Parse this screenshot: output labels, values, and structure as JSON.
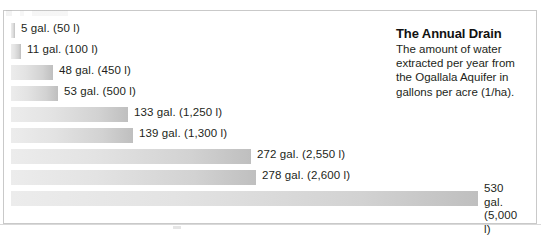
{
  "figure": {
    "name": "the-annual-drain-bar-chart",
    "width": 541,
    "height": 235,
    "background": "#ffffff",
    "frame_color": "#c9c9c9"
  },
  "caption": {
    "title": "The Annual Drain",
    "body": "The amount of water extracted per year from the Ogallala Aquifer in gallons per acre (1/ha)."
  },
  "colors": {
    "bar_light": "#ececec",
    "bar_dark": "#bfbfbf",
    "text": "#231f20",
    "title": "#111111"
  },
  "chart_data": {
    "type": "bar",
    "orientation": "horizontal",
    "title": "The Annual Drain",
    "subtitle": "The amount of water extracted per year from the Ogallala Aquifer in gallons per acre (1/ha).",
    "xlabel": "",
    "ylabel": "",
    "unit": "gallons per acre per year (liters per hectare)",
    "grid": false,
    "axis_visible": false,
    "legend": "none",
    "xlim": [
      0,
      530
    ],
    "categories": [
      "",
      "",
      "",
      "",
      "",
      "",
      "",
      "",
      ""
    ],
    "values": [
      5,
      11,
      48,
      53,
      133,
      139,
      272,
      278,
      530
    ],
    "values_liters": [
      50,
      100,
      450,
      500,
      1250,
      1300,
      2550,
      2600,
      5000
    ],
    "bars": [
      {
        "value": 5,
        "liters": 50,
        "label": "5 gal. (50 l)",
        "label_lines": [
          "5 gal. (50 l)"
        ]
      },
      {
        "value": 11,
        "liters": 100,
        "label": "11 gal. (100 l)",
        "label_lines": [
          "11 gal. (100 l)"
        ]
      },
      {
        "value": 48,
        "liters": 450,
        "label": "48 gal. (450 l)",
        "label_lines": [
          "48 gal. (450 l)"
        ]
      },
      {
        "value": 53,
        "liters": 500,
        "label": "53 gal. (500 l)",
        "label_lines": [
          "53 gal. (500 l)"
        ]
      },
      {
        "value": 133,
        "liters": 1250,
        "label": "133 gal. (1,250 l)",
        "label_lines": [
          "133 gal. (1,250 l)"
        ]
      },
      {
        "value": 139,
        "liters": 1300,
        "label": "139 gal. (1,300 l)",
        "label_lines": [
          "139 gal. (1,300 l)"
        ]
      },
      {
        "value": 272,
        "liters": 2550,
        "label": "272 gal. (2,550 l)",
        "label_lines": [
          "272 gal. (2,550 l)"
        ]
      },
      {
        "value": 278,
        "liters": 2600,
        "label": "278 gal. (2,600 l)",
        "label_lines": [
          "278 gal. (2,600 l)"
        ]
      },
      {
        "value": 530,
        "liters": 5000,
        "label": "530 gal.\n(5,000 l)",
        "label_lines": [
          "530 gal.",
          "(5,000 l)"
        ]
      }
    ]
  },
  "layout": {
    "bar_origin_x": 11,
    "first_row_y": 23,
    "row_step": 21,
    "bar_height": 15,
    "px_per_gallon": 0.8811,
    "label_gap": 6
  }
}
